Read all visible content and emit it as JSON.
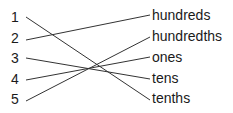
{
  "left_items": [
    {
      "label": "1",
      "y": 17
    },
    {
      "label": "2",
      "y": 38
    },
    {
      "label": "3",
      "y": 58
    },
    {
      "label": "4",
      "y": 79
    },
    {
      "label": "5",
      "y": 99
    }
  ],
  "right_items": [
    {
      "label": "hundreds",
      "y": 15
    },
    {
      "label": "hundredths",
      "y": 36
    },
    {
      "label": "ones",
      "y": 57
    },
    {
      "label": "tens",
      "y": 78
    },
    {
      "label": "tenths",
      "y": 98
    }
  ],
  "connections": [
    {
      "from": "1",
      "to": "tenths"
    },
    {
      "from": "2",
      "to": "hundreds"
    },
    {
      "from": "3",
      "to": "tens"
    },
    {
      "from": "4",
      "to": "ones"
    },
    {
      "from": "5",
      "to": "hundredths"
    }
  ],
  "line_color": "#333333"
}
